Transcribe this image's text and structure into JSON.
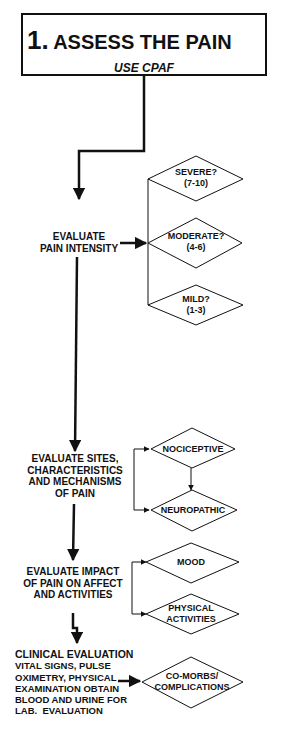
{
  "title": {
    "number": "1.",
    "heading": "ASSESS THE PAIN",
    "subtitle": "USE CPAF"
  },
  "steps": [
    {
      "label_lines": [
        "EVALUATE",
        "PAIN INTENSITY"
      ],
      "options": [
        {
          "lines": [
            "SEVERE?",
            "(7-10)"
          ]
        },
        {
          "lines": [
            "MODERATE?",
            "(4-6)"
          ]
        },
        {
          "lines": [
            "MILD?",
            "(1-3)"
          ]
        }
      ]
    },
    {
      "label_lines": [
        "EVALUATE SITES,",
        "CHARACTERISTICS",
        "AND MECHANISMS",
        "OF PAIN"
      ],
      "options": [
        {
          "lines": [
            "NOCICEPTIVE"
          ]
        },
        {
          "lines": [
            "NEUROPATHIC"
          ]
        }
      ]
    },
    {
      "label_lines": [
        "EVALUATE IMPACT",
        "OF PAIN ON AFFECT",
        "AND ACTIVITIES"
      ],
      "options": [
        {
          "lines": [
            "MOOD"
          ]
        },
        {
          "lines": [
            "PHYSICAL",
            "ACTIVITIES"
          ]
        }
      ]
    },
    {
      "label_lines": [
        "CLINICAL EVALUATION",
        "VITAL SIGNS, PULSE",
        "OXIMETRY, PHYSICAL",
        "EXAMINATION OBTAIN",
        "BLOOD AND URINE FOR",
        "LAB.  EVALUATION"
      ],
      "options": [
        {
          "lines": [
            "CO-MORBS/",
            "COMPLICATIONS"
          ]
        }
      ]
    }
  ]
}
